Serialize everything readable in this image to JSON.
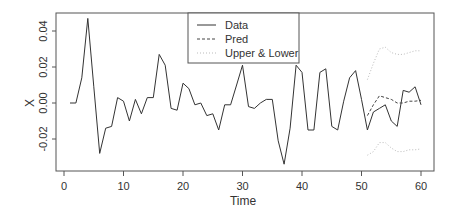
{
  "chart_data": {
    "type": "line",
    "title": "",
    "xlabel": "Time",
    "ylabel": "X",
    "xlim": [
      0,
      60
    ],
    "ylim": [
      -0.036,
      0.05
    ],
    "xticks": [
      0,
      10,
      20,
      30,
      40,
      50,
      60
    ],
    "yticks": [
      -0.02,
      0.0,
      0.02,
      0.04
    ],
    "ytick_labels": [
      "-0.02",
      "0.00",
      "0.02",
      "0.04"
    ],
    "grid": false,
    "legend_position": "top-center",
    "legend": [
      {
        "label": "Data",
        "style": "solid",
        "color": "#333333"
      },
      {
        "label": "Pred",
        "style": "dashed",
        "color": "#555555"
      },
      {
        "label": "Upper & Lower",
        "style": "dotted",
        "color": "#bbbbbb"
      }
    ],
    "series": [
      {
        "name": "Data",
        "x": [
          1,
          2,
          3,
          4,
          5,
          6,
          7,
          8,
          9,
          10,
          11,
          12,
          13,
          14,
          15,
          16,
          17,
          18,
          19,
          20,
          21,
          22,
          23,
          24,
          25,
          26,
          27,
          28,
          29,
          30,
          31,
          32,
          33,
          34,
          35,
          36,
          37,
          38,
          39,
          40,
          41,
          42,
          43,
          44,
          45,
          46,
          47,
          48,
          49,
          50,
          51,
          52,
          53,
          54,
          55,
          56,
          57,
          58,
          59,
          60
        ],
        "values": [
          0.0,
          0.0,
          0.014,
          0.047,
          0.009,
          -0.028,
          -0.014,
          -0.013,
          0.003,
          0.001,
          -0.01,
          0.002,
          -0.006,
          0.003,
          0.003,
          0.027,
          0.021,
          -0.003,
          -0.004,
          0.011,
          0.008,
          -0.001,
          0.0,
          -0.007,
          -0.006,
          -0.015,
          -0.001,
          -0.001,
          0.01,
          0.021,
          -0.002,
          -0.003,
          0.0,
          0.002,
          0.002,
          -0.021,
          -0.034,
          -0.014,
          0.021,
          0.017,
          -0.015,
          -0.015,
          0.017,
          0.019,
          -0.013,
          -0.015,
          0.001,
          0.014,
          0.018,
          0.002,
          -0.015,
          -0.005,
          -0.003,
          -0.001,
          -0.01,
          -0.013,
          0.007,
          0.006,
          0.009,
          -0.001
        ]
      },
      {
        "name": "Pred",
        "x": [
          51,
          52,
          53,
          54,
          55,
          56,
          57,
          58,
          59,
          60
        ],
        "values": [
          -0.007,
          -0.001,
          0.004,
          0.003,
          0.002,
          0.0,
          0.0,
          0.001,
          0.001,
          0.0015
        ]
      },
      {
        "name": "Upper",
        "x": [
          51,
          52,
          53,
          54,
          55,
          56,
          57,
          58,
          59,
          60
        ],
        "values": [
          0.013,
          0.022,
          0.03,
          0.031,
          0.028,
          0.027,
          0.027,
          0.028,
          0.029,
          0.029
        ]
      },
      {
        "name": "Lower",
        "x": [
          51,
          52,
          53,
          54,
          55,
          56,
          57,
          58,
          59,
          60
        ],
        "values": [
          -0.029,
          -0.027,
          -0.022,
          -0.022,
          -0.025,
          -0.027,
          -0.027,
          -0.026,
          -0.026,
          -0.0255
        ]
      }
    ]
  },
  "axes": {
    "xlabel": "Time",
    "ylabel": "X",
    "xtick_labels": [
      "0",
      "10",
      "20",
      "30",
      "40",
      "50",
      "60"
    ],
    "ytick_labels": [
      "-0.02",
      "0.00",
      "0.02",
      "0.04"
    ]
  },
  "legend": {
    "items": [
      {
        "label": "Data"
      },
      {
        "label": "Pred"
      },
      {
        "label": "Upper & Lower"
      }
    ]
  }
}
